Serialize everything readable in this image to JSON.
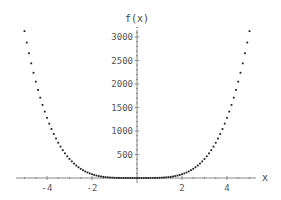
{
  "chart_data": {
    "type": "scatter",
    "title": "",
    "xlabel": "x",
    "ylabel": "f(x)",
    "function": "f(x) = 5x^4",
    "xlim": [
      -5.1,
      5.8
    ],
    "ylim": [
      -80,
      3300
    ],
    "x_ticks": [
      -4,
      -2,
      2,
      4
    ],
    "x_tick_labels": [
      "-4",
      "-2",
      "2",
      "4"
    ],
    "y_ticks": [
      500,
      1000,
      1500,
      2000,
      2500,
      3000
    ],
    "y_tick_labels": [
      "500",
      "1000",
      "1500",
      "2000",
      "2500",
      "3000"
    ],
    "grid": false,
    "legend": null,
    "series": [
      {
        "name": "f(x)",
        "x_start": -5,
        "x_end": 5,
        "x_step": 0.1,
        "color": "#222222"
      }
    ]
  },
  "colors": {
    "axis": "#888888",
    "points": "#222222",
    "text": "#555555"
  }
}
